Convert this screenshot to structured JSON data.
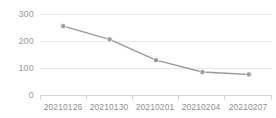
{
  "chart_data": {
    "type": "line",
    "title": "",
    "subtitle": "",
    "xlabel": "",
    "ylabel": "",
    "categories": [
      "20210126",
      "20210130",
      "20210201",
      "20210204",
      "20210207"
    ],
    "x": [
      "20210126",
      "20210130",
      "20210201",
      "20210204",
      "20210207"
    ],
    "values": [
      257,
      208,
      131,
      87,
      78
    ],
    "series": [
      {
        "name": "count",
        "values": [
          257,
          208,
          131,
          87,
          78
        ]
      }
    ],
    "ylim": [
      0,
      300
    ],
    "y_ticks": [
      0,
      100,
      200,
      300
    ],
    "y_tick_labels": [
      "0",
      "100",
      "200",
      "300"
    ],
    "x_tick_labels": [
      "20210126",
      "20210130",
      "20210201",
      "20210204",
      "20210207"
    ],
    "grid": true,
    "grid_axis": "y",
    "legend": false,
    "legend_position": "none",
    "markers": true,
    "marker_shape": "circle",
    "annotations": []
  },
  "style": {
    "background": "#ffffff",
    "line_color": "#9b9b9b",
    "marker_color": "#9b9b9b",
    "grid_color": "#e8e8e8",
    "axis_color": "#d6d6d6",
    "tick_label_color": "#949494"
  },
  "axes": {
    "y_labels": [
      {
        "text": "300",
        "top": 9
      },
      {
        "text": "200",
        "top": 36
      },
      {
        "text": "100",
        "top": 63
      },
      {
        "text": "0",
        "top": 90
      }
    ],
    "x_labels": [
      {
        "text": "20210126",
        "left": 40
      },
      {
        "text": "20210130",
        "left": 86
      },
      {
        "text": "20210201",
        "left": 132
      },
      {
        "text": "20210204",
        "left": 178
      },
      {
        "text": "20210207",
        "left": 224
      }
    ]
  }
}
